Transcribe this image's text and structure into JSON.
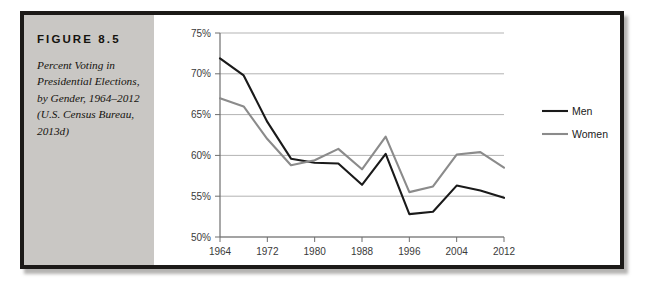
{
  "figure": {
    "label": "FIGURE 8.5",
    "caption": "Percent Voting in Presidential Elections, by Gender, 1964–2012 (U.S. Census Bureau, 2013d)"
  },
  "colors": {
    "panel_background": "#c9c7c4",
    "frame": "#1c1a18",
    "men_line": "#1a1a1a",
    "women_line": "#8b8b8b",
    "gridline": "#b3b3b3",
    "axis": "#6e6e6e",
    "tick_text": "#3a3a3a"
  },
  "chart_data": {
    "type": "line",
    "title": "",
    "xlabel": "",
    "ylabel": "",
    "xlim": [
      1964,
      2012
    ],
    "ylim": [
      50,
      75
    ],
    "y_tick_labels": [
      "50%",
      "55%",
      "60%",
      "65%",
      "70%",
      "75%"
    ],
    "y_ticks": [
      50,
      55,
      60,
      65,
      70,
      75
    ],
    "x_tick_labels": [
      "1964",
      "1972",
      "1980",
      "1988",
      "1996",
      "2004",
      "2012"
    ],
    "x_ticks": [
      1964,
      1972,
      1980,
      1988,
      1996,
      2004,
      2012
    ],
    "x": [
      1964,
      1968,
      1972,
      1976,
      1980,
      1984,
      1988,
      1992,
      1996,
      2000,
      2004,
      2008,
      2012
    ],
    "grid": true,
    "legend_position": "right",
    "series": [
      {
        "name": "Men",
        "color": "#1a1a1a",
        "values": [
          71.9,
          69.8,
          64.1,
          59.6,
          59.1,
          59.0,
          56.4,
          60.2,
          52.8,
          53.1,
          56.3,
          55.7,
          54.8
        ]
      },
      {
        "name": "Women",
        "color": "#8b8b8b",
        "values": [
          67.0,
          66.0,
          62.0,
          58.8,
          59.4,
          60.8,
          58.3,
          62.3,
          55.5,
          56.2,
          60.1,
          60.4,
          58.5
        ]
      }
    ]
  },
  "legend": {
    "items": [
      {
        "label": "Men"
      },
      {
        "label": "Women"
      }
    ]
  }
}
